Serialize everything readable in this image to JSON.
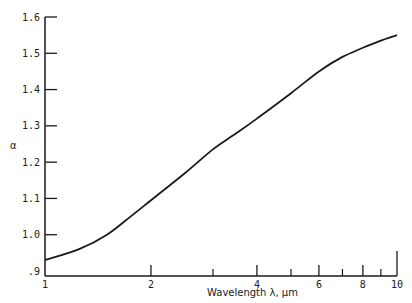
{
  "chart_data": {
    "type": "line",
    "title": "",
    "xlabel": "Wavelength  λ,  μm",
    "ylabel": "α",
    "xscale": "log",
    "xlim": [
      1,
      10
    ],
    "ylim": [
      0.9,
      1.6
    ],
    "grid": false,
    "legend": null,
    "x_major_ticks": [
      1,
      2,
      4,
      6,
      8,
      10
    ],
    "x_tick_labels": [
      "1",
      "2",
      "4",
      "6",
      "8",
      "10"
    ],
    "x_minor_ticks": [
      3,
      5,
      7,
      9
    ],
    "y_ticks": [
      0.9,
      1.0,
      1.1,
      1.2,
      1.3,
      1.4,
      1.5,
      1.6
    ],
    "y_tick_labels": [
      ".9",
      "1.0",
      "1.1",
      "1.2",
      "1.3",
      "1.4",
      "1.5",
      "1.6"
    ],
    "series": [
      {
        "name": "alpha",
        "x": [
          1,
          1.25,
          1.5,
          1.75,
          2,
          2.5,
          3,
          3.5,
          4,
          5,
          6,
          7,
          8,
          9,
          10
        ],
        "values": [
          0.93,
          0.96,
          1.0,
          1.05,
          1.095,
          1.17,
          1.235,
          1.28,
          1.32,
          1.39,
          1.45,
          1.49,
          1.515,
          1.535,
          1.55
        ]
      }
    ]
  }
}
